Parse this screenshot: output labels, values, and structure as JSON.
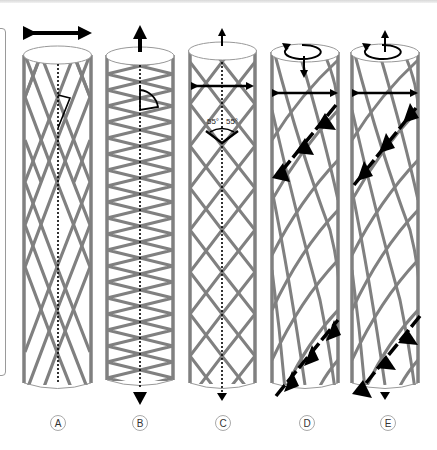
{
  "figure": {
    "type": "helical fiber architecture diagram",
    "panels": [
      {
        "label": "A",
        "fiber_pattern": "wide crossed helix (low angle)",
        "top_arrow": "horizontal double-headed",
        "angle_marker": "small angle from axis"
      },
      {
        "label": "B",
        "fiber_pattern": "tight crossed helix (high angle)",
        "top_arrow": "up",
        "bottom_arrow": "down",
        "angle_marker": "large angle from axis"
      },
      {
        "label": "C",
        "fiber_pattern": "crossed helix at 55°",
        "top_arrow": "up",
        "bottom_arrow": "down",
        "horizontal_arrow": "double-headed",
        "angle_labels": [
          "55°",
          "55°"
        ]
      },
      {
        "label": "D",
        "fiber_pattern": "twisted crossed helix",
        "top_arrow": "rotation + down",
        "horizontal_arrow": "double-headed",
        "helix_arrows": "dashed arrows pointing down-left (top) and up-right (bottom)"
      },
      {
        "label": "E",
        "fiber_pattern": "twisted crossed helix",
        "top_arrow": "rotation + up",
        "bottom_arrow": "down",
        "horizontal_arrow": "double-headed",
        "helix_arrows": "dashed arrows pointing up-right (top) and down-left (bottom)"
      }
    ],
    "angle_text": "55°",
    "labels": [
      "A",
      "B",
      "C",
      "D",
      "E"
    ]
  },
  "colors": {
    "fiber": "#808080",
    "arrow": "#000000",
    "outline": "#999999",
    "background": "#ffffff"
  }
}
